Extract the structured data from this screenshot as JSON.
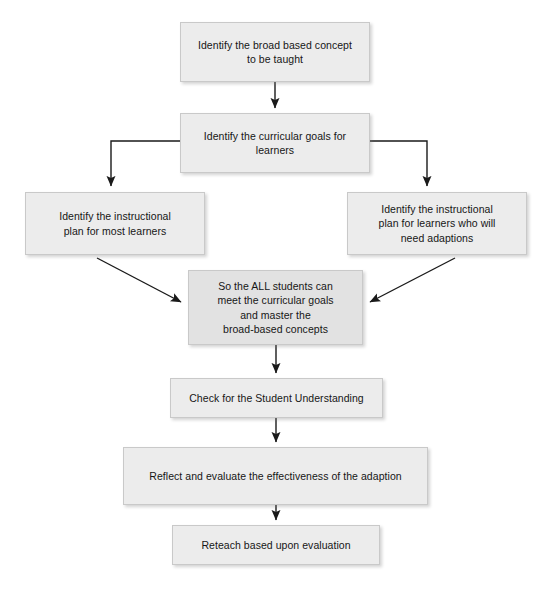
{
  "diagram": {
    "type": "flowchart",
    "direction": "top-to-bottom",
    "palette": {
      "node_fill": "#ececec",
      "node_fill_emphasis": "#e2e2e2",
      "node_border": "#c9c9c9",
      "text": "#161616",
      "connector": "#1a1a1a",
      "background": "#ffffff"
    },
    "nodes": [
      {
        "id": "n1",
        "label": "Identify the broad based concept\nto be taught",
        "x": 180,
        "y": 22,
        "w": 190,
        "h": 60,
        "emphasis": false
      },
      {
        "id": "n2",
        "label": "Identify the curricular goals for\nlearners",
        "x": 180,
        "y": 113,
        "w": 190,
        "h": 60,
        "emphasis": false
      },
      {
        "id": "n3",
        "label": "Identify the instructional\nplan for most learners",
        "x": 25,
        "y": 192,
        "w": 180,
        "h": 63,
        "emphasis": false
      },
      {
        "id": "n4",
        "label": "Identify the instructional\nplan for learners who will\nneed adaptions",
        "x": 347,
        "y": 192,
        "w": 180,
        "h": 63,
        "emphasis": false
      },
      {
        "id": "n5",
        "label": "So the ALL students can\nmeet the curricular goals\nand master the\nbroad-based concepts",
        "x": 188,
        "y": 270,
        "w": 175,
        "h": 75,
        "emphasis": true
      },
      {
        "id": "n6",
        "label": "Check for the Student Understanding",
        "x": 170,
        "y": 378,
        "w": 213,
        "h": 40,
        "emphasis": false
      },
      {
        "id": "n7",
        "label": "Reflect and evaluate the effectiveness of the adaption",
        "x": 123,
        "y": 447,
        "w": 305,
        "h": 58,
        "emphasis": false
      },
      {
        "id": "n8",
        "label": "Reteach based upon evaluation",
        "x": 172,
        "y": 525,
        "w": 208,
        "h": 40,
        "emphasis": false
      }
    ],
    "edges": [
      {
        "id": "e1",
        "from": "n1",
        "to": "n2",
        "style": "straight-vertical",
        "arrow": "down"
      },
      {
        "id": "e2",
        "from": "n2",
        "to": "n3",
        "style": "elbow-left",
        "arrow": "down"
      },
      {
        "id": "e3",
        "from": "n2",
        "to": "n4",
        "style": "elbow-right",
        "arrow": "down"
      },
      {
        "id": "e4",
        "from": "n3",
        "to": "n5",
        "style": "diagonal",
        "arrow": "down-right"
      },
      {
        "id": "e5",
        "from": "n4",
        "to": "n5",
        "style": "diagonal",
        "arrow": "down-left"
      },
      {
        "id": "e6",
        "from": "n5",
        "to": "n6",
        "style": "straight-vertical",
        "arrow": "down"
      },
      {
        "id": "e7",
        "from": "n6",
        "to": "n7",
        "style": "straight-vertical",
        "arrow": "down"
      },
      {
        "id": "e8",
        "from": "n7",
        "to": "n8",
        "style": "straight-vertical",
        "arrow": "down"
      }
    ]
  }
}
